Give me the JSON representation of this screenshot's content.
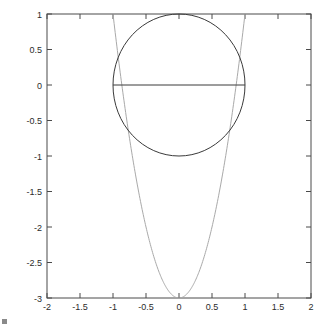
{
  "chart_data": {
    "type": "line",
    "title": "",
    "subtitle": "",
    "xlabel": "",
    "ylabel": "",
    "xlim": [
      -2,
      2
    ],
    "ylim": [
      -3,
      1
    ],
    "grid": false,
    "legend": "none",
    "background_color": "#ffffff",
    "axis_color": "#4a4a4a",
    "xticks": [
      -2,
      -1.5,
      -1,
      -0.5,
      0,
      0.5,
      1,
      1.5,
      2
    ],
    "xticklabels": [
      "-2",
      "-1.5",
      "-1",
      "-0.5",
      "0",
      "0.5",
      "1",
      "1.5",
      "2"
    ],
    "yticks": [
      1,
      0.5,
      0,
      -0.5,
      -1,
      -1.5,
      -2,
      -2.5,
      -3
    ],
    "yticklabels": [
      "1",
      "0.5",
      "0",
      "-0.5",
      "-1",
      "-1.5",
      "-2",
      "-2.5",
      "-3"
    ],
    "series": [
      {
        "name": "unit-circle",
        "shape": "circle",
        "center": [
          0,
          0
        ],
        "radius": 1,
        "color": "#3a3a3a",
        "linewidth": 1
      },
      {
        "name": "horizontal-diameter",
        "shape": "segment",
        "points": [
          [
            -1,
            0
          ],
          [
            1,
            0
          ]
        ],
        "color": "#3a3a3a",
        "linewidth": 1
      },
      {
        "name": "parabola",
        "shape": "parabola",
        "equation": "y = 4*x^2 - 3",
        "vertex": [
          0,
          -3
        ],
        "coefficient_a": 4,
        "coefficient_b": 0,
        "coefficient_c": -3,
        "x_range": [
          -1.0,
          1.0
        ],
        "color": "#a9a9a9",
        "linewidth": 1
      }
    ]
  },
  "figure": {
    "caption": ""
  }
}
